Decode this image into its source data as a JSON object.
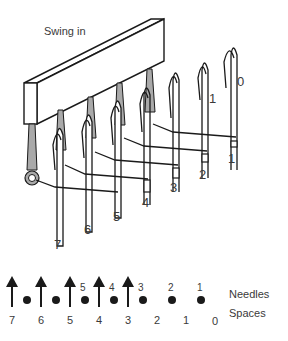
{
  "diagram": {
    "title_label": "Swing in",
    "needle_numbers_top": [
      "0",
      "1"
    ],
    "butt_numbers": [
      "1",
      "2",
      "3",
      "4",
      "5",
      "6",
      "7"
    ],
    "legend": {
      "needles_label": "Needles",
      "spaces_label": "Spaces",
      "arrow_count": 5,
      "dot_needle_labels": [
        "5",
        "4",
        "3",
        "2",
        "1"
      ],
      "space_labels": [
        "7",
        "6",
        "5",
        "4",
        "3",
        "2",
        "1",
        "0"
      ]
    },
    "colors": {
      "line": "#1a1a1a",
      "shade": "#a9a9a9",
      "text": "#3a3a3a"
    }
  }
}
